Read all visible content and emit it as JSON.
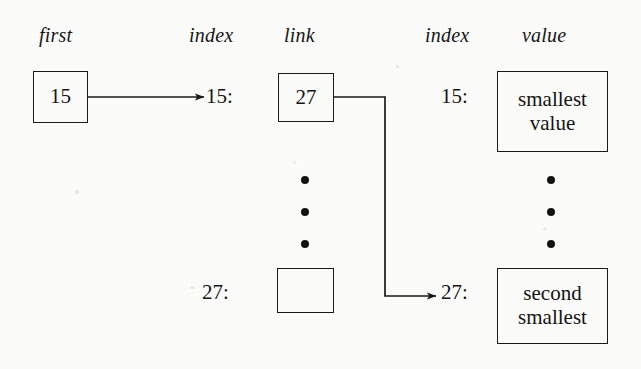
{
  "figure": {
    "kind": "linked-list-array-diagram",
    "background_color": "#fbfbf9",
    "ink_color": "#1a1a1a"
  },
  "headers": {
    "first": "first",
    "index_left": "index",
    "link": "link",
    "index_right": "index",
    "value": "value"
  },
  "first_pointer": {
    "box_value": "15"
  },
  "index_labels": {
    "left_top": "15:",
    "left_bottom": "27:",
    "right_top": "15:",
    "right_bottom": "27:"
  },
  "link_column": {
    "top_box_value": "27",
    "bottom_box_value": "",
    "ellipsis": "• • •"
  },
  "value_column": {
    "top_box_line1": "smallest",
    "top_box_line2": "value",
    "bottom_box_line1": "second",
    "bottom_box_line2": "smallest",
    "ellipsis": "• • •"
  },
  "arrows": {
    "first_to_index15": "arrow-right",
    "link27_to_index27": "elbow-arrow-right"
  }
}
